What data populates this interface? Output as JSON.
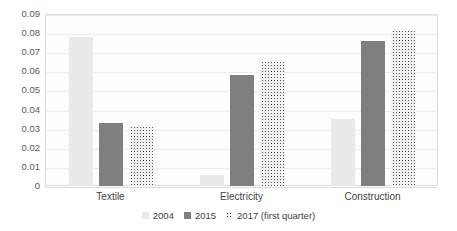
{
  "chart_data": {
    "type": "bar",
    "title": "",
    "xlabel": "",
    "ylabel": "",
    "categories": [
      "Textile",
      "Electricity",
      "Construction"
    ],
    "series": [
      {
        "name": "2004",
        "color": "#e9e9e9",
        "values": [
          0.078,
          0.006,
          0.035
        ]
      },
      {
        "name": "2015",
        "color": "#7f7f7f",
        "values": [
          0.033,
          0.058,
          0.076
        ]
      },
      {
        "name": "2017 (first quarter)",
        "color": "#f2f2f2",
        "values": [
          0.031,
          0.065,
          0.081
        ]
      }
    ],
    "ylim": [
      0,
      0.09
    ],
    "ytick_values": [
      0,
      0.01,
      0.02,
      0.03,
      0.04,
      0.05,
      0.06,
      0.07,
      0.08,
      0.09
    ],
    "ytick_labels": [
      "0",
      "0.01",
      "0.02",
      "0.03",
      "0.04",
      "0.05",
      "0.06",
      "0.07",
      "0.08",
      "0.09"
    ],
    "grid": true,
    "legend_position": "bottom",
    "legend_entries": [
      "2004",
      "2015",
      "2017 (first quarter)"
    ]
  }
}
